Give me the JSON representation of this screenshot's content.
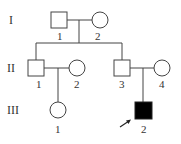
{
  "generations": [
    {
      "numeral": "I",
      "y": 20
    },
    {
      "numeral": "II",
      "y": 68
    },
    {
      "numeral": "III",
      "y": 110
    }
  ],
  "individuals": [
    {
      "id": "I-1",
      "label": "1",
      "sex": "male",
      "affected": false
    },
    {
      "id": "I-2",
      "label": "2",
      "sex": "female",
      "affected": false
    },
    {
      "id": "II-1",
      "label": "1",
      "sex": "male",
      "affected": false
    },
    {
      "id": "II-2",
      "label": "2",
      "sex": "female",
      "affected": false
    },
    {
      "id": "II-3",
      "label": "3",
      "sex": "male",
      "affected": false
    },
    {
      "id": "II-4",
      "label": "4",
      "sex": "female",
      "affected": false
    },
    {
      "id": "III-1",
      "label": "1",
      "sex": "female",
      "affected": false
    },
    {
      "id": "III-2",
      "label": "2",
      "sex": "male",
      "affected": true,
      "proband": true
    }
  ],
  "colors": {
    "line": "#444444",
    "affected": "#000000",
    "unaffected": "#ffffff"
  }
}
